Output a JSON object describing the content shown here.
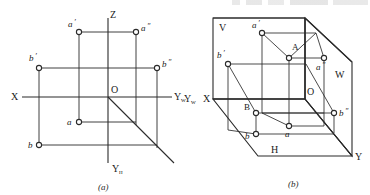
{
  "figure": {
    "title_partial_top": "",
    "subfigures": [
      {
        "caption": "(a)",
        "name": "two-view-projection-layout"
      },
      {
        "caption": "(b)",
        "name": "three-dimensional-projection-planes"
      }
    ]
  },
  "diagram_a": {
    "caption": "(a)",
    "axes": [
      {
        "id": "x-axis",
        "label": "X",
        "sub": ""
      },
      {
        "id": "z-axis",
        "label": "Z",
        "sub": ""
      },
      {
        "id": "yw-axis",
        "label": "Y",
        "sub": "W"
      },
      {
        "id": "yh-axis",
        "label": "Y",
        "sub": "H"
      }
    ],
    "origin_label": "O",
    "points": [
      {
        "id": "a-prime",
        "label": "a",
        "prime": "′",
        "x": 79,
        "y": 32
      },
      {
        "id": "a-double-prime",
        "label": "a",
        "prime": "″",
        "x": 136,
        "y": 32
      },
      {
        "id": "b-prime",
        "label": "b",
        "prime": "′",
        "x": 39,
        "y": 68
      },
      {
        "id": "b-double-prime",
        "label": "b",
        "prime": "″",
        "x": 157,
        "y": 68
      },
      {
        "id": "a-plain",
        "label": "a",
        "prime": "",
        "x": 79,
        "y": 122
      },
      {
        "id": "b-plain",
        "label": "b",
        "prime": "",
        "x": 39,
        "y": 145
      }
    ]
  },
  "diagram_b": {
    "caption": "(b)",
    "plane_labels": [
      {
        "id": "plane-v",
        "label": "V"
      },
      {
        "id": "plane-w",
        "label": "W"
      },
      {
        "id": "plane-h",
        "label": "H"
      }
    ],
    "axes": [
      {
        "id": "x-axis-b",
        "label": "X",
        "sub": ""
      },
      {
        "id": "yw-axis-b",
        "label": "Y",
        "sub": "W"
      },
      {
        "id": "y-axis-b",
        "label": "Y",
        "sub": ""
      }
    ],
    "origin_label": "O",
    "points": [
      {
        "id": "point-A",
        "label": "A",
        "prime": ""
      },
      {
        "id": "point-B",
        "label": "B",
        "prime": ""
      },
      {
        "id": "a-prime-b",
        "label": "a",
        "prime": "′"
      },
      {
        "id": "a-double-prime-b",
        "label": "a",
        "prime": "″"
      },
      {
        "id": "a-plain-b",
        "label": "a",
        "prime": ""
      },
      {
        "id": "b-prime-b",
        "label": "b",
        "prime": "′"
      },
      {
        "id": "b-double-prime-b",
        "label": "b",
        "prime": "″"
      },
      {
        "id": "b-plain-b",
        "label": "b",
        "prime": ""
      }
    ]
  },
  "style": {
    "line_color": "#2b2b2b",
    "label_color": "#1a1a1a",
    "background": "#ffffff",
    "marker_fill": "#ffffff"
  }
}
